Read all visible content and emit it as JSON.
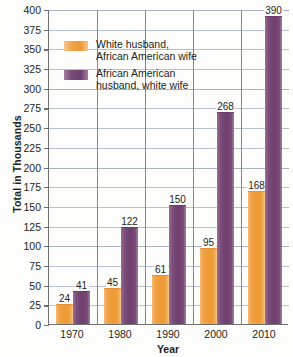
{
  "chart_data": {
    "type": "bar",
    "title": "",
    "xlabel": "Year",
    "ylabel": "Total in Thousands",
    "categories": [
      "1970",
      "1980",
      "1990",
      "2000",
      "2010"
    ],
    "ylim": [
      0,
      400
    ],
    "ytick_step": 25,
    "yticks": [
      "400",
      "375",
      "350",
      "325",
      "300",
      "275",
      "250",
      "225",
      "200",
      "175",
      "150",
      "125",
      "100",
      "75",
      "50",
      "25",
      "0"
    ],
    "grid": true,
    "legend_position": "upper-left-inside",
    "series": [
      {
        "name": "White husband,\nAfrican American wife",
        "color": "#ef9a33",
        "values": [
          24,
          45,
          61,
          95,
          168
        ]
      },
      {
        "name": "African American\nhusband, white wife",
        "color": "#6e3f6e",
        "values": [
          41,
          122,
          150,
          268,
          390
        ]
      }
    ]
  },
  "axis": {
    "y_title": "Total in Thousands",
    "x_title": "Year"
  },
  "legend": {
    "items": [
      {
        "label": "White husband,\nAfrican American wife",
        "swatch": "orange"
      },
      {
        "label": "African American\nhusband, white wife",
        "swatch": "purple"
      }
    ]
  },
  "colors": {
    "orange": "#ef9a33",
    "purple": "#6e3f6e",
    "axis": "#6f6f72",
    "grid": "#b9bfcb",
    "text": "#231f20",
    "background": "#fdfdfb"
  }
}
